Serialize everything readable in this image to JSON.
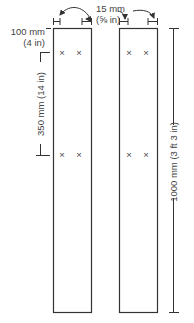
{
  "diagram": {
    "colors": {
      "line": "#333333",
      "text": "#444444",
      "background": "#ffffff"
    },
    "boards": [
      {
        "name": "left-board",
        "screws": [
          {
            "row": "top"
          },
          {
            "row": "middle"
          }
        ]
      },
      {
        "name": "right-board",
        "screws": [
          {
            "row": "top"
          },
          {
            "row": "middle"
          }
        ]
      }
    ],
    "dimensions": {
      "edge_offset": {
        "metric": "15 mm",
        "imperial": "(⅝ in)"
      },
      "top_offset": {
        "metric": "100 mm",
        "imperial": "(4 in)"
      },
      "screw_spacing": {
        "label": "350 mm (14 in)"
      },
      "board_length": {
        "label": "1000 mm (3 ft 3 in)"
      }
    },
    "screw_mark": "×"
  }
}
